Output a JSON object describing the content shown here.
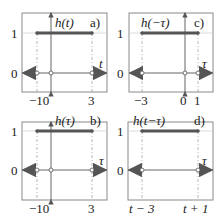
{
  "panels": [
    {
      "id": "a",
      "title": "h(t)",
      "tag": "a)",
      "axis_var": "t",
      "y_ticks": [
        "1",
        "0"
      ],
      "x_ticks": [
        "−10",
        "3"
      ],
      "plateau": {
        "from": "−10",
        "to": "3",
        "level": 1
      },
      "has_vertical_axis": true
    },
    {
      "id": "c",
      "title": "h(−τ)",
      "tag": "c)",
      "axis_var": "τ",
      "y_ticks": [
        "1",
        "0"
      ],
      "x_ticks": [
        "−3",
        "0",
        "1"
      ],
      "plateau": {
        "from": "−3",
        "to": "10",
        "level": 1
      },
      "has_vertical_axis": true
    },
    {
      "id": "b",
      "title": "h(τ)",
      "tag": "b)",
      "axis_var": "τ",
      "y_ticks": [
        "1",
        "0"
      ],
      "x_ticks": [
        "−10",
        "3"
      ],
      "plateau": {
        "from": "−10",
        "to": "3",
        "level": 1
      },
      "has_vertical_axis": true
    },
    {
      "id": "d",
      "title": "h(t−τ)",
      "tag": "d)",
      "axis_var": "τ",
      "y_ticks": [
        "1",
        "0"
      ],
      "x_ticks": [
        "t − 3",
        "t + 1"
      ],
      "plateau": {
        "from": "t−3",
        "to": "t+1",
        "level": 1
      },
      "has_vertical_axis": false
    }
  ],
  "colors": {
    "frame": "#8a8a8a",
    "grid": "#c8c8c8",
    "plateau": "#555555",
    "axis": "#555555",
    "text": "#222222"
  }
}
